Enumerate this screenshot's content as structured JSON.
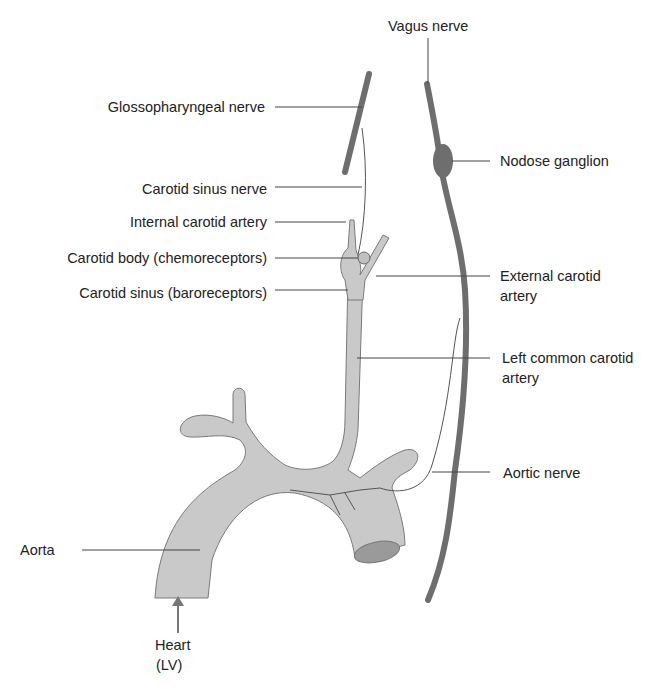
{
  "diagram": {
    "colors": {
      "vessel": "#c9c9c9",
      "vessel_stroke": "#7a7a7a",
      "nerve": "#6e6e6e",
      "leader": "#444444",
      "text": "#222222"
    },
    "labels": {
      "vagus_nerve": "Vagus nerve",
      "glossopharyngeal_nerve": "Glossopharyngeal nerve",
      "nodose_ganglion": "Nodose ganglion",
      "carotid_sinus_nerve": "Carotid sinus nerve",
      "internal_carotid_artery": "Internal carotid artery",
      "carotid_body": "Carotid body (chemoreceptors)",
      "carotid_sinus": "Carotid sinus (baroreceptors)",
      "external_carotid_artery_1": "External carotid",
      "external_carotid_artery_2": "artery",
      "left_common_carotid_1": "Left common carotid",
      "left_common_carotid_2": "artery",
      "aortic_nerve": "Aortic nerve",
      "aorta": "Aorta",
      "heart_1": "Heart",
      "heart_2": "(LV)"
    }
  }
}
